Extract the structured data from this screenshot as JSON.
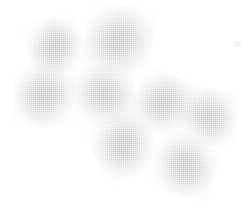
{
  "scene": {
    "title": "Scattered rounded triangle shapes",
    "width": 250,
    "height": 207,
    "background_color": "#ffffff",
    "shape_count": 8,
    "shape_kind": "rounded-triangle",
    "fill_color": "#b4b4b4",
    "texture": "halftone-dither",
    "count_label": "8"
  },
  "shapes": [
    {
      "id": "shape-1",
      "label": "rounded triangle 1",
      "cx": 55,
      "cy": 46,
      "size": 41,
      "rotation": -18,
      "fill": "#b2b2b2"
    },
    {
      "id": "shape-2",
      "label": "rounded triangle 2",
      "cx": 119,
      "cy": 40,
      "size": 50,
      "rotation": 8,
      "fill": "#b0b0b0"
    },
    {
      "id": "shape-3",
      "label": "rounded triangle 3",
      "cx": 44,
      "cy": 96,
      "size": 45,
      "rotation": 182,
      "fill": "#b4b4b4"
    },
    {
      "id": "shape-4",
      "label": "rounded triangle 4",
      "cx": 104,
      "cy": 94,
      "size": 44,
      "rotation": 262,
      "fill": "#b2b2b2"
    },
    {
      "id": "shape-5",
      "label": "rounded triangle 5",
      "cx": 163,
      "cy": 103,
      "size": 43,
      "rotation": 200,
      "fill": "#b4b4b4"
    },
    {
      "id": "shape-6",
      "label": "rounded triangle 6",
      "cx": 208,
      "cy": 116,
      "size": 42,
      "rotation": 278,
      "fill": "#b2b2b2"
    },
    {
      "id": "shape-7",
      "label": "rounded triangle 7",
      "cx": 123,
      "cy": 146,
      "size": 45,
      "rotation": 152,
      "fill": "#b2b2b2"
    },
    {
      "id": "shape-8",
      "label": "rounded triangle 8",
      "cx": 185,
      "cy": 165,
      "size": 45,
      "rotation": 288,
      "fill": "#b6b6b6"
    }
  ],
  "specks": [
    {
      "id": "speck-1",
      "label": "faint artifact",
      "x": 234,
      "y": 41,
      "w": 7,
      "h": 6,
      "color": "#f4f4f4"
    }
  ]
}
